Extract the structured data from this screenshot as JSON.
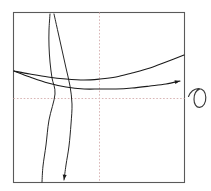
{
  "figure": {
    "title": "",
    "background_color": "#ffffff",
    "width": 211,
    "height": 191
  },
  "plot_frame": {
    "name": "plot-border",
    "x": 13.5,
    "y": 12.5,
    "width": 171,
    "height": 170,
    "stroke_color": "#5a5a5a",
    "fill_color": "#ffffff"
  },
  "gridlines": {
    "style": "dotted",
    "color": "#d9b6b6",
    "vertical": {
      "label": "vertical-gridline",
      "x": 99.5,
      "y1": 12.5,
      "y2": 182.5
    },
    "horizontal": {
      "label": "horizontal-gridline",
      "y": 98.5,
      "x1": 13.5,
      "x2": 184.5
    }
  },
  "annotation": {
    "name": "handwritten-sigma-glyph",
    "text": "σ",
    "color": "#3a3a3a",
    "x": 188,
    "y": 92
  },
  "chart_data": {
    "type": "line",
    "title": "",
    "xlabel": "",
    "ylabel": "",
    "grid": true,
    "legend": false,
    "legend_position": "none",
    "xlim": [
      13.5,
      184.5
    ],
    "ylim": [
      12.5,
      182.5
    ],
    "axis_origin": {
      "x": 99.5,
      "y": 98.5
    },
    "series": [
      {
        "name": "upper-u-curve",
        "style": "solid",
        "color": "#1a1a1a",
        "arrow_end": false,
        "points": [
          [
            14,
            71
          ],
          [
            30,
            74
          ],
          [
            48,
            77
          ],
          [
            66,
            79
          ],
          [
            84,
            80
          ],
          [
            100,
            79
          ],
          [
            116,
            77
          ],
          [
            132,
            73
          ],
          [
            150,
            68
          ],
          [
            166,
            62
          ],
          [
            184,
            55
          ]
        ]
      },
      {
        "name": "lower-u-curve",
        "style": "solid",
        "color": "#1a1a1a",
        "arrow_end": true,
        "arrow_at": [
          180,
          81
        ],
        "points": [
          [
            14,
            71
          ],
          [
            30,
            77
          ],
          [
            48,
            83
          ],
          [
            66,
            87
          ],
          [
            84,
            89
          ],
          [
            100,
            89
          ],
          [
            116,
            89
          ],
          [
            132,
            88
          ],
          [
            150,
            86
          ],
          [
            166,
            84
          ],
          [
            180,
            81
          ]
        ]
      },
      {
        "name": "left-steep-curve",
        "style": "solid",
        "color": "#1a1a1a",
        "arrow_end": false,
        "points": [
          [
            50,
            14
          ],
          [
            49,
            30
          ],
          [
            49,
            46
          ],
          [
            50,
            62
          ],
          [
            52,
            78
          ],
          [
            55,
            94
          ],
          [
            49,
            120
          ],
          [
            46,
            145
          ],
          [
            43,
            166
          ],
          [
            42,
            182
          ]
        ]
      },
      {
        "name": "right-steep-curve",
        "style": "solid",
        "color": "#1a1a1a",
        "arrow_end": true,
        "arrow_at": [
          64,
          180
        ],
        "points": [
          [
            54,
            14
          ],
          [
            58,
            32
          ],
          [
            62,
            50
          ],
          [
            66,
            68
          ],
          [
            70,
            86
          ],
          [
            72,
            104
          ],
          [
            71,
            124
          ],
          [
            69,
            146
          ],
          [
            66,
            165
          ],
          [
            64,
            180
          ]
        ]
      }
    ]
  }
}
